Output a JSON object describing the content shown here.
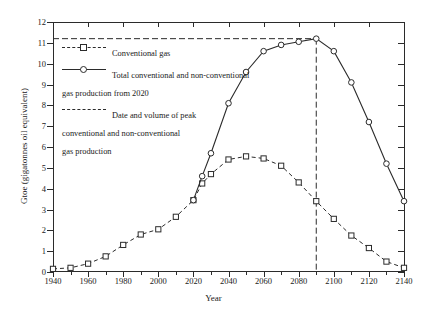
{
  "chart_data": {
    "type": "line",
    "title": "",
    "xlabel": "Year",
    "ylabel": "Gtoe (gigatonnes oil equivalent)",
    "xlim": [
      1940,
      2140
    ],
    "ylim": [
      0,
      12
    ],
    "xticks": [
      1940,
      1960,
      1980,
      2000,
      2020,
      2040,
      2060,
      2080,
      2100,
      2120,
      2140
    ],
    "xticks_minor": [
      1950,
      1970,
      1990,
      2010,
      2030,
      2050,
      2070,
      2090,
      2110,
      2130
    ],
    "yticks": [
      0,
      1,
      2,
      3,
      4,
      5,
      6,
      7,
      8,
      9,
      10,
      11,
      12
    ],
    "grid": false,
    "legend_position": "upper-left",
    "series": [
      {
        "name": "Conventional gas",
        "style": "dashed",
        "marker": "square",
        "x": [
          1940,
          1950,
          1960,
          1970,
          1980,
          1990,
          2000,
          2010,
          2020,
          2025,
          2030,
          2040,
          2050,
          2060,
          2070,
          2080,
          2090,
          2100,
          2110,
          2120,
          2130,
          2140
        ],
        "y": [
          0.15,
          0.2,
          0.4,
          0.75,
          1.3,
          1.8,
          2.05,
          2.65,
          3.45,
          4.25,
          4.7,
          5.4,
          5.55,
          5.45,
          5.1,
          4.3,
          3.4,
          2.55,
          1.75,
          1.15,
          0.5,
          0.2
        ]
      },
      {
        "name": "Total conventional and non-conventional gas production from 2020",
        "style": "solid",
        "marker": "circle",
        "x": [
          2020,
          2025,
          2030,
          2040,
          2050,
          2060,
          2070,
          2080,
          2090,
          2100,
          2110,
          2120,
          2130,
          2140
        ],
        "y": [
          3.45,
          4.6,
          5.7,
          8.1,
          9.6,
          10.6,
          10.9,
          11.05,
          11.2,
          10.6,
          9.1,
          7.2,
          5.2,
          3.4
        ]
      }
    ],
    "reference_lines": [
      {
        "name": "Date and volume of peak conventional and non-conventional gas production",
        "style": "long-dashed",
        "horizontal_y": 11.2,
        "vertical_x": 2090
      }
    ]
  },
  "legend": {
    "entries": [
      {
        "label": "Conventional gas",
        "symbol": "dashed-line-square-marker"
      },
      {
        "label": "Total conventional and non-conventional\ngas production from 2020",
        "symbol": "solid-line-circle-marker"
      },
      {
        "label": "Date and volume of peak\nconventional and non-conventional\ngas production",
        "symbol": "long-dashed-line"
      }
    ]
  },
  "axes": {
    "x_title": "Year",
    "y_title": "Gtoe (gigatonnes oil equivalent)",
    "x_tick_labels": [
      "1940",
      "1960",
      "1980",
      "2000",
      "2020",
      "2040",
      "2060",
      "2080",
      "2100",
      "2120",
      "2140"
    ],
    "y_tick_labels": [
      "0",
      "1",
      "2",
      "3",
      "4",
      "5",
      "6",
      "7",
      "8",
      "9",
      "10",
      "11",
      "12"
    ]
  },
  "colors": {
    "line": "#2b2b2b",
    "background": "#ffffff",
    "text": "#1a1a1a"
  }
}
